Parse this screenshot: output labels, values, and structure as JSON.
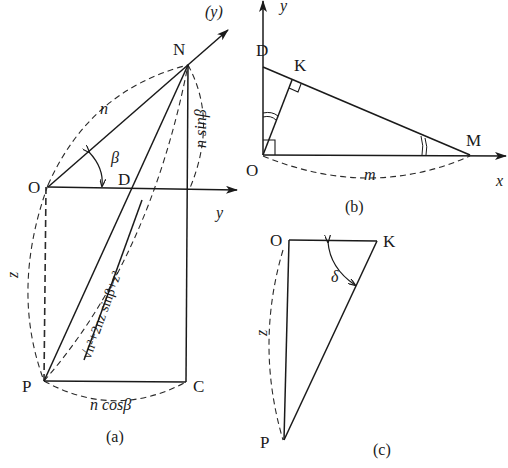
{
  "figure_a": {
    "caption": "(a)",
    "points": {
      "O": "O",
      "N": "N",
      "D": "D",
      "P": "P",
      "C": "C"
    },
    "axis_labels": {
      "y_paren": "(y)",
      "y": "y"
    },
    "labels": {
      "n": "n",
      "beta": "β",
      "n_sin_beta": "n sinβ",
      "z": "z",
      "n_cos_beta": "n cosβ",
      "diagonal": "√n²+2nz sinβ+z²"
    }
  },
  "figure_b": {
    "caption": "(b)",
    "points": {
      "D": "D",
      "K": "K",
      "O": "O",
      "M": "M"
    },
    "axis_labels": {
      "y": "y",
      "x": "x"
    },
    "labels": {
      "m": "m"
    }
  },
  "figure_c": {
    "caption": "(c)",
    "points": {
      "O": "O",
      "K": "K",
      "P": "P"
    },
    "labels": {
      "z": "z",
      "delta": "δ"
    }
  }
}
